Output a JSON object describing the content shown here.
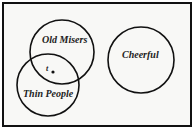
{
  "diagram": {
    "type": "venn",
    "sets": [
      {
        "name": "old-misers",
        "label": "Old Misers",
        "cx": 62,
        "cy": 52,
        "r": 32
      },
      {
        "name": "thin-people",
        "label": "Thin People",
        "cx": 48,
        "cy": 85,
        "r": 31
      },
      {
        "name": "cheerful",
        "label": "Cheerful",
        "cx": 141,
        "cy": 60,
        "r": 33
      }
    ],
    "point": {
      "label": "t",
      "x": 53,
      "y": 72
    },
    "stroke_color": "#111111",
    "background": "#f8f8f6"
  }
}
